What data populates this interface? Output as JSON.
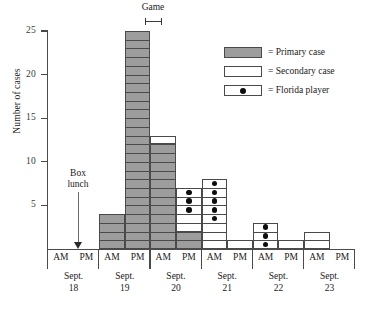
{
  "chart_data": {
    "type": "bar",
    "title": "",
    "xlabel": "",
    "ylabel": "Number of cases",
    "ylim": [
      0,
      25
    ],
    "yticks": [
      5,
      10,
      15,
      20,
      25
    ],
    "grid": false,
    "legend_position": "top-right",
    "categories": [
      "Sept. 18 AM",
      "Sept. 18 PM",
      "Sept. 19 AM",
      "Sept. 19 PM",
      "Sept. 20 AM",
      "Sept. 20 PM",
      "Sept. 21 AM",
      "Sept. 21 PM",
      "Sept. 22 AM",
      "Sept. 22 PM",
      "Sept. 23 AM",
      "Sept. 23 PM"
    ],
    "series": [
      {
        "name": "Primary case",
        "color": "#9d9d9d",
        "values": [
          0,
          0,
          4,
          25,
          12,
          2,
          0,
          0,
          0,
          0,
          0,
          0
        ]
      },
      {
        "name": "Secondary case",
        "color": "#ffffff",
        "values": [
          0,
          0,
          0,
          0,
          1,
          5,
          8,
          1,
          3,
          1,
          2,
          0
        ]
      }
    ],
    "totals": [
      0,
      0,
      4,
      25,
      13,
      7,
      8,
      1,
      3,
      1,
      2,
      0
    ],
    "florida_player_counts": [
      0,
      0,
      0,
      0,
      0,
      3,
      5,
      0,
      3,
      0,
      0,
      0
    ],
    "annotations": [
      {
        "text": "Box lunch",
        "at": "Sept. 18 PM",
        "marker": "down-arrow"
      },
      {
        "text": "Game",
        "at": "Sept. 19 PM",
        "marker": "interval-bracket"
      }
    ]
  },
  "axis": {
    "y_title": "Number of cases",
    "y_ticks": [
      "25",
      "20",
      "15",
      "10",
      "5"
    ]
  },
  "legend": {
    "items": [
      {
        "label": "= Primary case",
        "swatch": "primary"
      },
      {
        "label": "= Secondary case",
        "swatch": "secondary"
      },
      {
        "label": "= Florida player",
        "swatch": "player"
      }
    ]
  },
  "annotations": {
    "box_lunch_line1": "Box",
    "box_lunch_line2": "lunch",
    "game": "Game"
  },
  "xaxis": {
    "days": [
      {
        "month": "Sept.",
        "day": "18",
        "am": "AM",
        "pm": "PM"
      },
      {
        "month": "Sept.",
        "day": "19",
        "am": "AM",
        "pm": "PM"
      },
      {
        "month": "Sept.",
        "day": "20",
        "am": "AM",
        "pm": "PM"
      },
      {
        "month": "Sept.",
        "day": "21",
        "am": "AM",
        "pm": "PM"
      },
      {
        "month": "Sept.",
        "day": "22",
        "am": "AM",
        "pm": "PM"
      },
      {
        "month": "Sept.",
        "day": "23",
        "am": "AM",
        "pm": "PM"
      }
    ]
  },
  "colors": {
    "primary_fill": "#9d9d9d",
    "secondary_fill": "#ffffff",
    "dot": "#0d0d0d",
    "axis": "#4a4a4a"
  }
}
